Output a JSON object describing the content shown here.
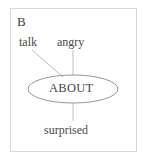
{
  "figure": {
    "panel_label": "B",
    "type": "ego-network-diagram",
    "background_color": "#ffffff",
    "border_color": "#d8d8d8",
    "edge_color": "#b0b0b0",
    "text_color": "#4a4a4a",
    "node_outline_color": "#8a8a8a"
  },
  "center_node": {
    "label": "ABOUT",
    "shape": "ellipse",
    "cx": 73,
    "cy": 89,
    "rx": 45,
    "ry": 14
  },
  "peripheral_nodes": [
    {
      "label": "talk",
      "position": "top-left",
      "x": 19,
      "y": 36
    },
    {
      "label": "angry",
      "position": "top-center",
      "x": 57,
      "y": 36
    },
    {
      "label": "surprised",
      "position": "bottom-center",
      "x": 44,
      "y": 124
    }
  ],
  "edges": [
    {
      "from": "talk",
      "to": "ABOUT",
      "x1": 32,
      "y1": 50,
      "x2": 63,
      "y2": 77
    },
    {
      "from": "angry",
      "to": "ABOUT",
      "x1": 73,
      "y1": 50,
      "x2": 73,
      "y2": 75
    },
    {
      "from": "ABOUT",
      "to": "surprised",
      "x1": 73,
      "y1": 103,
      "x2": 73,
      "y2": 121
    }
  ]
}
